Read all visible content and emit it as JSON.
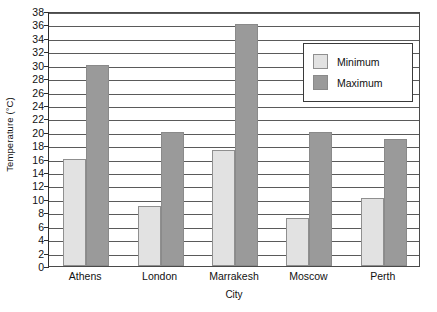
{
  "chart_data": {
    "type": "bar",
    "title": "",
    "subtitle": "",
    "xlabel": "City",
    "ylabel": "Temperature (°C)",
    "categories": [
      "Athens",
      "London",
      "Marrakesh",
      "Moscow",
      "Perth"
    ],
    "series": [
      {
        "name": "Minimum",
        "color": "#e2e2e2",
        "values": [
          16,
          9,
          17.3,
          7.1,
          10.1
        ]
      },
      {
        "name": "Maximum",
        "color": "#9a9a9a",
        "values": [
          30,
          20,
          36,
          20,
          19
        ]
      }
    ],
    "ylim": [
      0,
      38
    ],
    "ytick_step": 2,
    "yticks": [
      0,
      2,
      4,
      6,
      8,
      10,
      12,
      14,
      16,
      18,
      20,
      22,
      24,
      26,
      28,
      30,
      32,
      34,
      36,
      38
    ],
    "ytick_labels": [
      "0",
      "2",
      "4",
      "6",
      "8",
      "10",
      "12",
      "14",
      "16",
      "18",
      "20",
      "22",
      "24",
      "26",
      "28",
      "30",
      "32",
      "34",
      "36",
      "38"
    ],
    "grid": true,
    "grid_axis": "y",
    "legend_position": "upper right",
    "legend_entries": [
      "Minimum",
      "Maximum"
    ],
    "annotations": []
  }
}
